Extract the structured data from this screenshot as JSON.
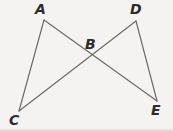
{
  "figure": {
    "type": "geometry-diagram",
    "background_color": "#f4f3f1",
    "stroke_color": "#6b6b6b",
    "label_color": "#2b2b2b",
    "stroke_width": 1.2,
    "width": 173,
    "height": 131,
    "points": [
      {
        "id": "A",
        "label": "A",
        "x": 44,
        "y": 20,
        "label_x": 35,
        "label_y": 2
      },
      {
        "id": "D",
        "label": "D",
        "x": 136,
        "y": 21,
        "label_x": 130,
        "label_y": 2
      },
      {
        "id": "B",
        "label": "B",
        "x": 90,
        "y": 58,
        "label_x": 85,
        "label_y": 37
      },
      {
        "id": "C",
        "label": "C",
        "x": 19,
        "y": 111,
        "label_x": 9,
        "label_y": 113
      },
      {
        "id": "E",
        "label": "E",
        "x": 157,
        "y": 101,
        "label_x": 151,
        "label_y": 103
      }
    ],
    "segments": [
      {
        "id": "AC",
        "from": "A",
        "to": "C",
        "x1": 44,
        "y1": 20,
        "x2": 19,
        "y2": 111
      },
      {
        "id": "AE",
        "from": "A",
        "to": "E",
        "x1": 44,
        "y1": 20,
        "x2": 157,
        "y2": 101
      },
      {
        "id": "DC",
        "from": "D",
        "to": "C",
        "x1": 136,
        "y1": 21,
        "x2": 19,
        "y2": 111
      },
      {
        "id": "DE",
        "from": "D",
        "to": "E",
        "x1": 136,
        "y1": 21,
        "x2": 157,
        "y2": 101
      }
    ]
  }
}
